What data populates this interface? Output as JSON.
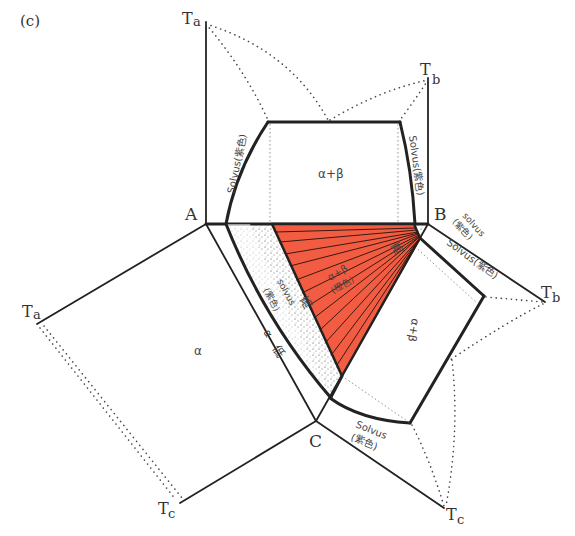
{
  "figure": {
    "panel_label": "(c)",
    "colors": {
      "red_region": "#f25c42",
      "lines": "#222222",
      "background": "#ffffff"
    },
    "vertices": {
      "A": "A",
      "B": "B",
      "C": "C"
    },
    "temperature_axes": {
      "ta_top": {
        "base": "T",
        "sub": "a"
      },
      "tb_top": {
        "base": "T",
        "sub": "b"
      },
      "ta_left": {
        "base": "T",
        "sub": "a"
      },
      "tc_left": {
        "base": "T",
        "sub": "c"
      },
      "tb_right": {
        "base": "T",
        "sub": "b"
      },
      "tc_right": {
        "base": "T",
        "sub": "c"
      }
    },
    "phase_labels": {
      "alpha_plus_beta_top": "α+β",
      "alpha_left": "α",
      "alpha_plus_beta_right": "α+β",
      "alpha_plus_beta_center": "α+β",
      "center_color_note": "(橙色)",
      "alpha_strip": "α",
      "low": "低",
      "high_left": "高",
      "high_right": "高"
    },
    "solvus_labels": {
      "top_left": "Solvus(紫色)",
      "top_right": "Solvus(紫色)",
      "b_small_word": "solvus",
      "b_small_color": "(紫色)",
      "right_edge": "Solvus(紫色)",
      "center_word": "solvus",
      "center_color": "(紫色)",
      "bottom_word": "Solvus",
      "bottom_color": "(紫色)"
    }
  }
}
